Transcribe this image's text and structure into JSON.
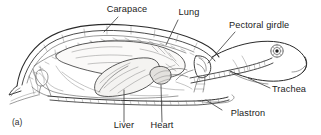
{
  "figure": {
    "caption_label": "(a)",
    "background_color": "#ffffff",
    "ink_color": "#2a2a2a",
    "text_color": "#1a1a1a"
  },
  "labels": [
    {
      "id": "carapace",
      "text": "Carapace",
      "anchor": "middle"
    },
    {
      "id": "lung",
      "text": "Lung",
      "anchor": "middle"
    },
    {
      "id": "pectoral-girdle",
      "text": "Pectoral girdle",
      "anchor": "start"
    },
    {
      "id": "trachea",
      "text": "Trachea",
      "anchor": "start"
    },
    {
      "id": "plastron",
      "text": "Plastron",
      "anchor": "middle"
    },
    {
      "id": "heart",
      "text": "Heart",
      "anchor": "middle"
    },
    {
      "id": "liver",
      "text": "Liver",
      "anchor": "middle"
    }
  ],
  "structures": [
    {
      "id": "carapace-shell",
      "name": "carapace (dorsal shell)"
    },
    {
      "id": "plastron-shell",
      "name": "plastron (ventral shell)"
    },
    {
      "id": "lung-organ",
      "name": "lung"
    },
    {
      "id": "liver-organ",
      "name": "liver"
    },
    {
      "id": "heart-organ",
      "name": "heart"
    },
    {
      "id": "trachea-tube",
      "name": "trachea"
    },
    {
      "id": "pectoral-bone",
      "name": "pectoral girdle"
    },
    {
      "id": "head",
      "name": "head"
    },
    {
      "id": "eye",
      "name": "eye"
    },
    {
      "id": "pelvic-bone",
      "name": "pelvic girdle"
    },
    {
      "id": "vertebral-column",
      "name": "vertebral column"
    }
  ]
}
